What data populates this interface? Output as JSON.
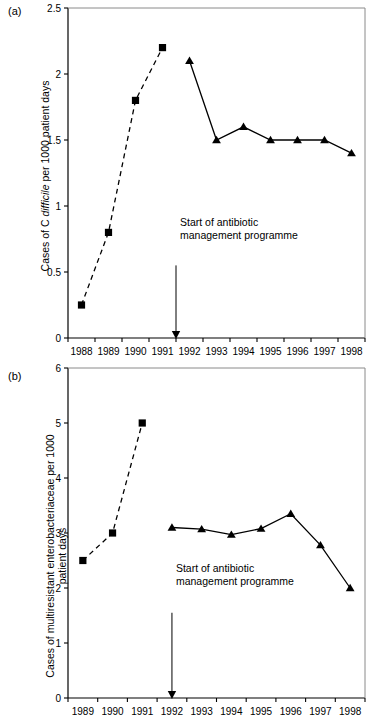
{
  "figure": {
    "panel_a_label": "(a)",
    "panel_b_label": "(b)",
    "annotation_line1": "Start of antibiotic",
    "annotation_line2": "management programme",
    "annotation_full": "Start of antibiotic management programme",
    "axis_color": "#000000",
    "marker_color": "#000000",
    "background": "#ffffff",
    "bottom_caption": ""
  },
  "chart_data": [
    {
      "id": "panel-a",
      "type": "line",
      "panel": "(a)",
      "title": "",
      "xlabel": "",
      "ylabel": "Cases of C difficile per 1000 patient days",
      "ylabel_italic_word": "difficile",
      "ylabel_part1": "Cases of C ",
      "ylabel_part2": "difficile",
      "ylabel_part3": " per 1000 patient days",
      "x": [
        1988,
        1989,
        1990,
        1991,
        1992,
        1993,
        1994,
        1995,
        1996,
        1997,
        1998
      ],
      "xtick_labels": [
        "1988",
        "1989",
        "1990",
        "1991",
        "1992",
        "1993",
        "1994",
        "1995",
        "1996",
        "1997",
        "1998"
      ],
      "ytick_labels": [
        "0",
        "0.5",
        "1",
        "1.5",
        "2",
        "2.5"
      ],
      "yticks": [
        0,
        0.5,
        1,
        1.5,
        2,
        2.5
      ],
      "ylim": [
        0,
        2.5
      ],
      "grid": false,
      "legend": "none",
      "series": [
        {
          "name": "Before programme",
          "marker": "square",
          "linestyle": "dashed",
          "x": [
            1988,
            1989,
            1990,
            1991
          ],
          "values": [
            0.25,
            0.8,
            1.8,
            2.2
          ]
        },
        {
          "name": "After programme",
          "marker": "triangle",
          "linestyle": "solid",
          "x": [
            1992,
            1993,
            1994,
            1995,
            1996,
            1997,
            1998
          ],
          "values": [
            2.1,
            1.5,
            1.6,
            1.5,
            1.5,
            1.5,
            1.4
          ]
        }
      ],
      "annotations": [
        {
          "text": "Start of antibiotic management programme",
          "arrow_x": 1991.5,
          "arrow_y_from": 0.55,
          "arrow_y_to": 0.0
        }
      ]
    },
    {
      "id": "panel-b",
      "type": "line",
      "panel": "(b)",
      "title": "",
      "xlabel": "",
      "ylabel": "Cases of multiresistant enterobacteriaceae per 1000 patient days",
      "ylabel_line1": "Cases of multiresistant enterobacteriaceae per 1000",
      "ylabel_line2": "patient days",
      "x": [
        1989,
        1990,
        1991,
        1992,
        1993,
        1994,
        1995,
        1996,
        1997,
        1998
      ],
      "xtick_labels": [
        "1989",
        "1990",
        "1991",
        "1992",
        "1993",
        "1994",
        "1995",
        "1996",
        "1997",
        "1998"
      ],
      "ytick_labels": [
        "0",
        "1",
        "2",
        "3",
        "4",
        "5",
        "6"
      ],
      "yticks": [
        0,
        1,
        2,
        3,
        4,
        5,
        6
      ],
      "ylim": [
        0,
        6
      ],
      "grid": false,
      "legend": "none",
      "series": [
        {
          "name": "Before programme",
          "marker": "square",
          "linestyle": "dashed",
          "x": [
            1989,
            1990,
            1991
          ],
          "values": [
            2.5,
            3.0,
            5.0
          ]
        },
        {
          "name": "After programme",
          "marker": "triangle",
          "linestyle": "solid",
          "x": [
            1992,
            1993,
            1994,
            1995,
            1996,
            1997,
            1998
          ],
          "values": [
            3.1,
            3.07,
            2.97,
            3.08,
            3.35,
            2.78,
            2.0
          ]
        }
      ],
      "annotations": [
        {
          "text": "Start of antibiotic management programme",
          "arrow_x": 1992.0,
          "arrow_y_from": 1.55,
          "arrow_y_to": 0.0
        }
      ]
    }
  ]
}
